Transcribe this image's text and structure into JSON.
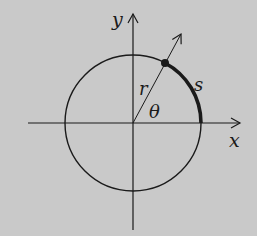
{
  "diagram": {
    "background": "#c9c9c9",
    "stroke_color": "#1a1a1a",
    "labels": {
      "x_axis": "x",
      "y_axis": "y",
      "radius": "r",
      "angle": "θ",
      "arc": "s"
    },
    "circle": {
      "cx": 133,
      "cy": 123,
      "r": 68
    },
    "angle_degrees": 62,
    "point": {
      "x": 165,
      "y": 63
    }
  }
}
